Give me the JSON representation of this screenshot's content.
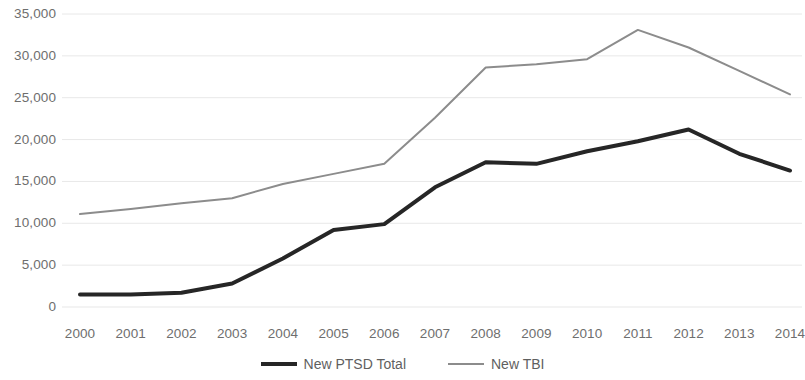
{
  "chart_data": {
    "type": "line",
    "title": "",
    "subtitle": "",
    "xlabel": "",
    "ylabel": "",
    "categories": [
      "2000",
      "2001",
      "2002",
      "2003",
      "2004",
      "2005",
      "2006",
      "2007",
      "2008",
      "2009",
      "2010",
      "2011",
      "2012",
      "2013",
      "2014"
    ],
    "series": [
      {
        "name": "New PTSD Total",
        "color": "#262626",
        "line_width": 4,
        "values": [
          1500,
          1500,
          1700,
          2800,
          5800,
          9200,
          9900,
          14300,
          17300,
          17100,
          18600,
          19800,
          21200,
          18300,
          16300
        ]
      },
      {
        "name": "New TBI",
        "color": "#8c8c8c",
        "line_width": 2,
        "values": [
          11100,
          11700,
          12400,
          13000,
          14700,
          15900,
          17100,
          22600,
          28600,
          29000,
          29600,
          33100,
          31000,
          28200,
          25400
        ]
      }
    ],
    "ylim": [
      0,
      35000
    ],
    "y_tick_values": [
      0,
      5000,
      10000,
      15000,
      20000,
      25000,
      30000,
      35000
    ],
    "y_tick_labels": [
      "0",
      "5,000",
      "10,000",
      "15,000",
      "20,000",
      "25,000",
      "30,000",
      "35,000"
    ],
    "grid": true,
    "grid_color": "#e8e8e8",
    "legend_position": "bottom",
    "background": "#ffffff"
  },
  "legend": {
    "items": [
      {
        "label": "New PTSD Total"
      },
      {
        "label": "New TBI"
      }
    ]
  }
}
